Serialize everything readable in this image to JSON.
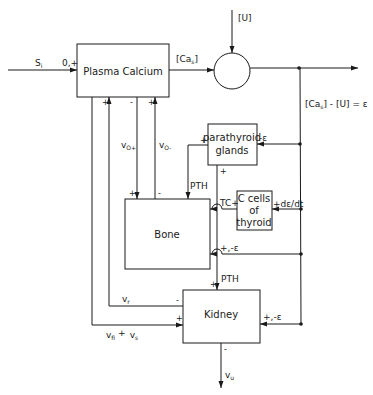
{
  "diagram": {
    "blocks": {
      "plasma_calcium": "Plasma  Calcium",
      "parathyroid_line1": "parathyroid",
      "parathyroid_line2": "glands",
      "c_cells_line1": "C  cells",
      "c_cells_line2": "of",
      "c_cells_line3": "thyroid",
      "bone": "Bone",
      "kidney": "Kidney",
      "summing_junction": ""
    },
    "signals": {
      "input_S": "S",
      "input_S_sub": "i",
      "plasma_input_sign": "0,+",
      "cas_label_open": "[Ca",
      "cas_label_sub": "s",
      "cas_label_close": "]",
      "u_input": "[U]",
      "error_eq": "[Ca",
      "error_eq_sub": "s",
      "error_eq_rest": "] - [U] = ε",
      "vo_plus": "v",
      "vo_plus_sub": "O+",
      "vo_minus": "v",
      "vo_minus_sub": "O-",
      "pth_bone": "PTH",
      "pth_kidney": "PTH",
      "parathyroid_in": "-ε",
      "parathyroid_out_sign": "+",
      "parathyroid_bone_sign": "+",
      "tc_label": "TC+",
      "c_cells_in": "+dε/dt",
      "bone_error_in": "+,-ε",
      "vr": "v",
      "vr_sub": "r",
      "vfi_vs": "v",
      "vfi_sub": "fi",
      "vfi_plus": "+",
      "vs": "v",
      "vs_sub": "s",
      "kidney_error_in": "+,-ε",
      "vu": "v",
      "vu_sub": "u",
      "plus": "+",
      "minus": "-"
    },
    "colors": {
      "line": "#1a1a1a",
      "background": "#ffffff"
    }
  }
}
